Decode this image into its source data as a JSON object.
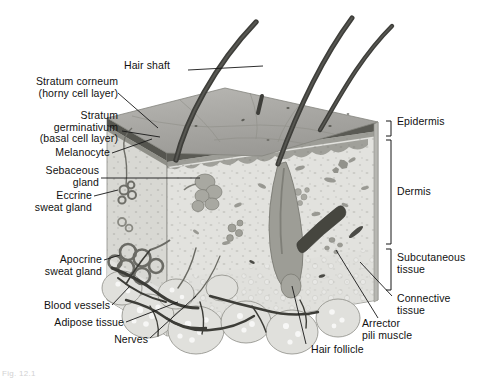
{
  "figure": {
    "caption_partial": "Fig. 12.1",
    "style": "grayscale medical illustration, 3D block diagram"
  },
  "palette": {
    "surface_top": "#a9a9a9",
    "surface_top_light": "#b8b7b3",
    "epidermis_band": "#5d5d5d",
    "dermis_face": "#dcdcd8",
    "dermis_side": "#cfcfcb",
    "subcutaneous": "#e6e6e2",
    "adipose": "#dcdcd6",
    "hair": "#4a4a4a",
    "follicle": "#9a9a9a",
    "vessel_dark": "#3a3a3a",
    "leader_line": "#1a1a1a",
    "text": "#111111",
    "background": "#ffffff"
  },
  "labels_left": [
    {
      "id": "stratum-corneum",
      "text": "Stratum corneum\n(horny cell layer)"
    },
    {
      "id": "stratum-germinativum",
      "text": "Stratum\ngerminativum\n(basal cell layer)"
    },
    {
      "id": "melanocyte",
      "text": "Melanocyte"
    },
    {
      "id": "sebaceous-gland",
      "text": "Sebaceous\ngland"
    },
    {
      "id": "eccrine-sweat-gland",
      "text": "Eccrine\nsweat gland"
    },
    {
      "id": "apocrine-sweat-gland",
      "text": "Apocrine\nsweat gland"
    },
    {
      "id": "blood-vessels",
      "text": "Blood vessels"
    },
    {
      "id": "adipose-tissue",
      "text": "Adipose tissue"
    },
    {
      "id": "nerves",
      "text": "Nerves"
    }
  ],
  "labels_top": [
    {
      "id": "hair-shaft",
      "text": "Hair shaft"
    }
  ],
  "labels_right": [
    {
      "id": "epidermis",
      "text": "Epidermis",
      "bracket": true
    },
    {
      "id": "dermis",
      "text": "Dermis",
      "bracket": true
    },
    {
      "id": "subcutaneous-tissue",
      "text": "Subcutaneous\ntissue",
      "bracket": true
    },
    {
      "id": "connective-tissue",
      "text": "Connective\ntissue",
      "bracket": false
    },
    {
      "id": "arrector-pili-muscle",
      "text": "Arrector\npili muscle",
      "bracket": false
    }
  ],
  "labels_bottom": [
    {
      "id": "hair-follicle",
      "text": "Hair follicle"
    }
  ],
  "structures": [
    "hair shaft",
    "hair follicle",
    "sebaceous gland",
    "eccrine sweat gland",
    "apocrine sweat gland",
    "arrector pili muscle",
    "melanocyte",
    "blood vessels",
    "nerves",
    "adipose tissue",
    "connective tissue"
  ]
}
